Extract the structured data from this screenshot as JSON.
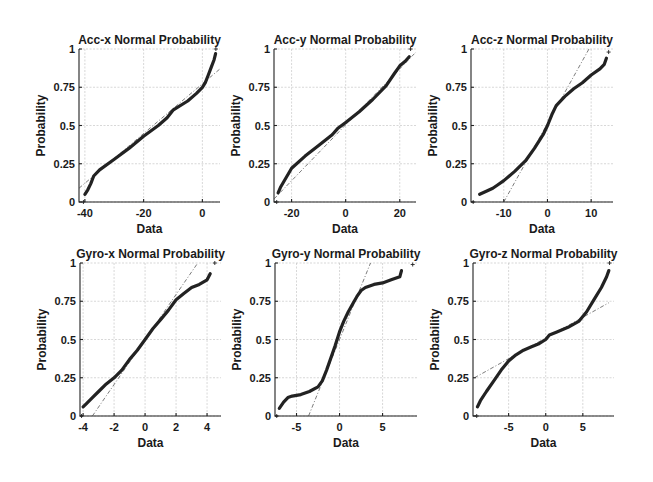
{
  "chart_data": [
    {
      "type": "scatter",
      "title": "Acc-x Normal Probability",
      "xlabel": "Data",
      "ylabel": "Probability",
      "xlim": [
        -42,
        6
      ],
      "ylim": [
        0,
        1
      ],
      "xticks": [
        -40,
        -20,
        0
      ],
      "yticks": [
        0,
        0.25,
        0.5,
        0.75,
        1
      ],
      "ytick_labels": [
        "0",
        "0.25",
        "0.5",
        "0.75",
        "1"
      ],
      "grid": true,
      "axes_px": {
        "left": 79,
        "top": 49,
        "right": 220,
        "bottom": 202
      },
      "reference_line": [
        [
          -42,
          0.09
        ],
        [
          6,
          0.87
        ]
      ],
      "points": [
        [
          -40.5,
          0.0
        ],
        [
          -40,
          0.05
        ],
        [
          -39,
          0.08
        ],
        [
          -38,
          0.12
        ],
        [
          -37,
          0.17
        ],
        [
          -35,
          0.21
        ],
        [
          -30,
          0.28
        ],
        [
          -25,
          0.35
        ],
        [
          -20,
          0.43
        ],
        [
          -15,
          0.5
        ],
        [
          -12,
          0.55
        ],
        [
          -10,
          0.6
        ],
        [
          -5,
          0.66
        ],
        [
          -2,
          0.71
        ],
        [
          0,
          0.75
        ],
        [
          1,
          0.78
        ],
        [
          2,
          0.83
        ],
        [
          3,
          0.88
        ],
        [
          4,
          0.93
        ],
        [
          4.5,
          0.97
        ],
        [
          4.6,
          1.0
        ]
      ]
    },
    {
      "type": "scatter",
      "title": "Acc-y Normal Probability",
      "xlabel": "Data",
      "ylabel": "Probability",
      "xlim": [
        -26.5,
        26
      ],
      "ylim": [
        0,
        1
      ],
      "xticks": [
        -20,
        0,
        20
      ],
      "yticks": [
        0,
        0.25,
        0.5,
        0.75,
        1
      ],
      "ytick_labels": [
        "0",
        "0.25",
        "0.5",
        "0.75",
        "1"
      ],
      "grid": true,
      "axes_px": {
        "left": 274,
        "top": 49,
        "right": 416,
        "bottom": 202
      },
      "reference_line": [
        [
          -26.5,
          0.02
        ],
        [
          26,
          0.98
        ]
      ],
      "points": [
        [
          -25.5,
          0.0
        ],
        [
          -25,
          0.06
        ],
        [
          -24,
          0.1
        ],
        [
          -22,
          0.16
        ],
        [
          -20,
          0.22
        ],
        [
          -15,
          0.3
        ],
        [
          -10,
          0.37
        ],
        [
          -5,
          0.44
        ],
        [
          -3,
          0.48
        ],
        [
          0,
          0.52
        ],
        [
          5,
          0.59
        ],
        [
          10,
          0.67
        ],
        [
          15,
          0.76
        ],
        [
          18,
          0.84
        ],
        [
          20,
          0.89
        ],
        [
          22,
          0.92
        ],
        [
          23.5,
          0.95
        ],
        [
          24,
          1.0
        ]
      ]
    },
    {
      "type": "scatter",
      "title": "Acc-z Normal Probability",
      "xlabel": "Data",
      "ylabel": "Probability",
      "xlim": [
        -17.5,
        15
      ],
      "ylim": [
        0,
        1
      ],
      "xticks": [
        -10,
        0,
        10
      ],
      "yticks": [
        0,
        0.25,
        0.5,
        0.75,
        1
      ],
      "ytick_labels": [
        "0",
        "0.25",
        "0.5",
        "0.75",
        "1"
      ],
      "grid": true,
      "axes_px": {
        "left": 471,
        "top": 49,
        "right": 613,
        "bottom": 202
      },
      "reference_line": [
        [
          -10,
          0.0
        ],
        [
          9.5,
          1.0
        ]
      ],
      "points": [
        [
          -17,
          0.0
        ],
        [
          -15.5,
          0.05
        ],
        [
          -14,
          0.07
        ],
        [
          -12.5,
          0.09
        ],
        [
          -11.5,
          0.11
        ],
        [
          -10,
          0.14
        ],
        [
          -7.5,
          0.2
        ],
        [
          -5,
          0.27
        ],
        [
          -3,
          0.35
        ],
        [
          -1,
          0.44
        ],
        [
          0,
          0.5
        ],
        [
          1,
          0.57
        ],
        [
          2,
          0.63
        ],
        [
          4,
          0.69
        ],
        [
          6,
          0.74
        ],
        [
          8,
          0.78
        ],
        [
          10,
          0.83
        ],
        [
          12,
          0.87
        ],
        [
          13,
          0.9
        ],
        [
          13.5,
          0.94
        ],
        [
          14,
          0.98
        ]
      ]
    },
    {
      "type": "scatter",
      "title": "Gyro-x Normal Probability",
      "xlabel": "Data",
      "ylabel": "Probability",
      "xlim": [
        -4.2,
        4.9
      ],
      "ylim": [
        0,
        1
      ],
      "xticks": [
        -4,
        -2,
        0,
        2,
        4
      ],
      "yticks": [
        0,
        0.25,
        0.5,
        0.75,
        1
      ],
      "ytick_labels": [
        "0",
        "0.25",
        "0.5",
        "0.75",
        "1"
      ],
      "grid": true,
      "axes_px": {
        "left": 80,
        "top": 263,
        "right": 221,
        "bottom": 416
      },
      "reference_line": [
        [
          -3.4,
          0.0
        ],
        [
          3.4,
          1.0
        ]
      ],
      "points": [
        [
          -4.1,
          0.0
        ],
        [
          -4,
          0.06
        ],
        [
          -3.8,
          0.08
        ],
        [
          -3.4,
          0.12
        ],
        [
          -3,
          0.16
        ],
        [
          -2.5,
          0.21
        ],
        [
          -2,
          0.25
        ],
        [
          -1.5,
          0.3
        ],
        [
          -1,
          0.37
        ],
        [
          -0.5,
          0.43
        ],
        [
          0,
          0.5
        ],
        [
          0.5,
          0.57
        ],
        [
          1,
          0.63
        ],
        [
          1.5,
          0.69
        ],
        [
          2,
          0.76
        ],
        [
          2.5,
          0.8
        ],
        [
          3,
          0.84
        ],
        [
          3.5,
          0.86
        ],
        [
          4,
          0.89
        ],
        [
          4.2,
          0.93
        ],
        [
          4.5,
          1.0
        ]
      ]
    },
    {
      "type": "scatter",
      "title": "Gyro-y Normal Probability",
      "xlabel": "Data",
      "ylabel": "Probability",
      "xlim": [
        -7.5,
        9
      ],
      "ylim": [
        0,
        1
      ],
      "xticks": [
        -5,
        0,
        5
      ],
      "yticks": [
        0,
        0.25,
        0.5,
        0.75,
        1
      ],
      "ytick_labels": [
        "0",
        "0.25",
        "0.5",
        "0.75",
        "1"
      ],
      "grid": true,
      "axes_px": {
        "left": 275,
        "top": 263,
        "right": 417,
        "bottom": 416
      },
      "reference_line": [
        [
          -3.6,
          0.0
        ],
        [
          3.6,
          1.0
        ]
      ],
      "points": [
        [
          -7.3,
          0.0
        ],
        [
          -7,
          0.05
        ],
        [
          -6.5,
          0.09
        ],
        [
          -6,
          0.12
        ],
        [
          -5.5,
          0.13
        ],
        [
          -4.5,
          0.14
        ],
        [
          -3.5,
          0.16
        ],
        [
          -2.5,
          0.19
        ],
        [
          -2,
          0.23
        ],
        [
          -1.5,
          0.3
        ],
        [
          -1,
          0.38
        ],
        [
          -0.5,
          0.46
        ],
        [
          0,
          0.55
        ],
        [
          0.5,
          0.62
        ],
        [
          1,
          0.68
        ],
        [
          1.5,
          0.73
        ],
        [
          2,
          0.78
        ],
        [
          2.5,
          0.82
        ],
        [
          3,
          0.84
        ],
        [
          4,
          0.86
        ],
        [
          5,
          0.87
        ],
        [
          6,
          0.89
        ],
        [
          7,
          0.91
        ],
        [
          7.2,
          0.95
        ],
        [
          8.5,
          0.99
        ]
      ]
    },
    {
      "type": "scatter",
      "title": "Gyro-z Normal Probability",
      "xlabel": "Data",
      "ylabel": "Probability",
      "xlim": [
        -9.8,
        9.2
      ],
      "ylim": [
        0,
        1
      ],
      "xticks": [
        -5,
        0,
        5
      ],
      "yticks": [
        0,
        0.25,
        0.5,
        0.75,
        1
      ],
      "ytick_labels": [
        "0",
        "0.25",
        "0.5",
        "0.75",
        "1"
      ],
      "grid": true,
      "axes_px": {
        "left": 473,
        "top": 263,
        "right": 614,
        "bottom": 416
      },
      "reference_line": [
        [
          -9.6,
          0.25
        ],
        [
          8.5,
          0.74
        ]
      ],
      "points": [
        [
          -9.3,
          0.0
        ],
        [
          -9.2,
          0.06
        ],
        [
          -8.8,
          0.1
        ],
        [
          -8,
          0.16
        ],
        [
          -7,
          0.23
        ],
        [
          -6,
          0.3
        ],
        [
          -5,
          0.36
        ],
        [
          -4,
          0.4
        ],
        [
          -3,
          0.43
        ],
        [
          -2,
          0.45
        ],
        [
          -1,
          0.47
        ],
        [
          0,
          0.5
        ],
        [
          0.5,
          0.53
        ],
        [
          1.5,
          0.55
        ],
        [
          3,
          0.58
        ],
        [
          4.5,
          0.62
        ],
        [
          5.5,
          0.68
        ],
        [
          6.5,
          0.76
        ],
        [
          7.5,
          0.84
        ],
        [
          8.2,
          0.91
        ],
        [
          8.5,
          0.95
        ],
        [
          8.6,
          1.0
        ]
      ]
    }
  ]
}
